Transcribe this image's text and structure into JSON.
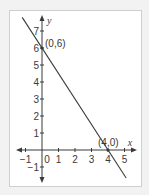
{
  "chart_data": {
    "type": "line",
    "title": "",
    "xlabel": "x",
    "ylabel": "y",
    "xlim": [
      -1.5,
      5.5
    ],
    "ylim": [
      -1.5,
      7.5
    ],
    "grid": false,
    "x_ticks": [
      -1,
      0,
      1,
      2,
      3,
      4,
      5
    ],
    "x_tick_labels": [
      "−1",
      "0",
      "1",
      "2",
      "3",
      "4",
      "5"
    ],
    "y_ticks": [
      -1,
      1,
      2,
      3,
      4,
      5,
      6,
      7
    ],
    "y_tick_labels": [
      "−1",
      "1",
      "2",
      "3",
      "4",
      "5",
      "6",
      "7"
    ],
    "series": [
      {
        "name": "y = 6 - 1.5x",
        "x": [
          -1.2,
          5.1
        ],
        "y": [
          7.8,
          -1.65
        ],
        "color": "#3a3a3a"
      }
    ],
    "points": [
      {
        "x": 0,
        "y": 6,
        "label": "(0,6)"
      },
      {
        "x": 4,
        "y": 0,
        "label": "(4,0)"
      }
    ],
    "colors": {
      "axis": "#3a3a3a",
      "frame_border": "#cfcfcf",
      "background": "#ffffff"
    }
  }
}
